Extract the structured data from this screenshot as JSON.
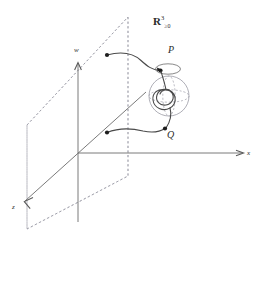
{
  "figure": {
    "title_label": "R",
    "space_superscript": "3",
    "space_subscript": "≥0",
    "background_color": "#ffffff",
    "stroke_color": "#4a4a4a",
    "dash_color": "#9a9aa5",
    "text_color": "#2b2b2b"
  },
  "axes": [
    {
      "id": "x",
      "label": "x",
      "direction": "right"
    },
    {
      "id": "w",
      "label": "w",
      "direction": "up"
    },
    {
      "id": "z",
      "label": "z",
      "direction": "down-left"
    }
  ],
  "points": [
    {
      "id": "P",
      "label": "P"
    },
    {
      "id": "Q",
      "label": "Q"
    }
  ],
  "elements": {
    "plane_name": "dashed-plane",
    "sphere_name": "sphere",
    "knot_name": "knotted-curve",
    "loop_name": "small-loop",
    "upper_path_name": "upper-path",
    "lower_path_name": "lower-path",
    "endpoint_upper_name": "upper-endpoint-dot",
    "endpoint_lower_name": "lower-endpoint-dot"
  }
}
